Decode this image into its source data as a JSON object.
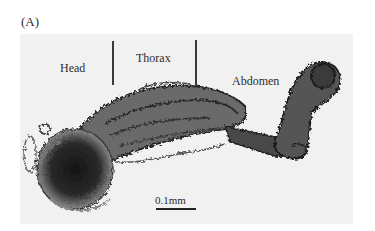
{
  "figure": {
    "panel_label": "(A)",
    "regions": [
      {
        "label": "Head"
      },
      {
        "label": "Thorax"
      },
      {
        "label": "Abdomen"
      }
    ],
    "scale_bar": {
      "label": "0.1mm"
    },
    "colors": {
      "background": "#f1f1f1",
      "specimen_dark": "#1f1f1f",
      "specimen_mid": "#5a5a5a",
      "divider": "#3a3a3a"
    }
  }
}
